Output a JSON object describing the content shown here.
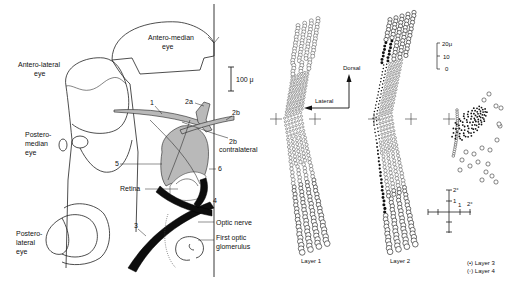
{
  "figure": {
    "left_panel": {
      "eyes": {
        "antero_median": [
          "Antero-median",
          "eye"
        ],
        "antero_lateral": [
          "Antero-lateral",
          "eye"
        ],
        "postero_median": [
          "Postero-",
          "median",
          "eye"
        ],
        "postero_lateral": [
          "Postero-",
          "lateral",
          "eye"
        ]
      },
      "scale_bar": "100 μ",
      "muscle_labels": {
        "m1": "1",
        "m2a": "2a",
        "m2b": "2b",
        "m2b_contra": [
          "2b",
          "contralateral"
        ],
        "m3": "3",
        "m4": "4",
        "m5": "5",
        "m6": "6"
      },
      "structures": {
        "retina": "Retina",
        "optic_nerve": "Optic nerve",
        "first_optic_glomerulus": [
          "First optic",
          "glomerulus"
        ]
      }
    },
    "orientation": {
      "dorsal": "Dorsal",
      "lateral": "Lateral"
    },
    "right_scale_bar": {
      "ticks": [
        "20μ",
        "10",
        "0"
      ]
    },
    "layers": {
      "layer1": "Layer 1",
      "layer2": "Layer 2"
    },
    "angle_cross": {
      "labels": [
        "2°",
        "1",
        "1",
        "2°"
      ]
    },
    "legend": {
      "layer3": "(•) Layer 3",
      "layer4": "(◦) Layer 4"
    },
    "colors": {
      "ink": "#111111",
      "shading": "#b9b9b9",
      "background": "#ffffff"
    }
  }
}
